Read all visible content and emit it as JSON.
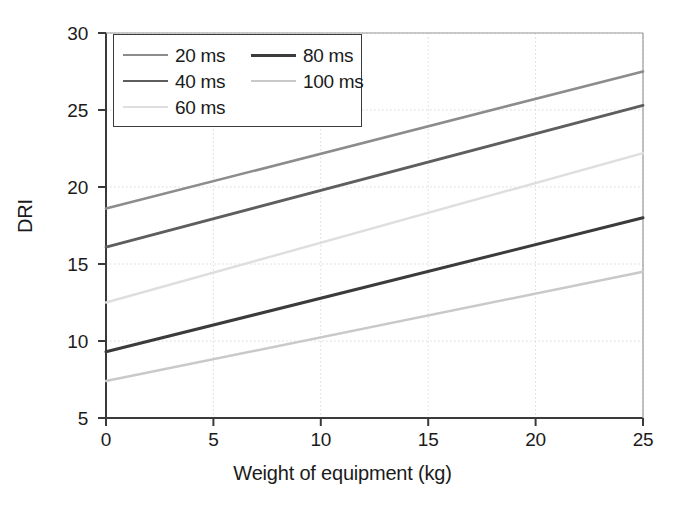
{
  "chart_data": {
    "type": "line",
    "title": "",
    "xlabel": "Weight of equipment (kg)",
    "ylabel": "DRI",
    "xlim": [
      0,
      25
    ],
    "ylim": [
      5,
      30
    ],
    "xticks": [
      0,
      5,
      10,
      15,
      20,
      25
    ],
    "yticks": [
      5,
      10,
      15,
      20,
      25,
      30
    ],
    "xtick_labels": [
      "0",
      "5",
      "10",
      "15",
      "20",
      "25"
    ],
    "ytick_labels": [
      "5",
      "10",
      "15",
      "20",
      "25",
      "30"
    ],
    "grid": "horizontal and vertical dotted light gridlines",
    "legend_position": "upper left inside axes",
    "x": [
      0,
      25
    ],
    "series": [
      {
        "name": "20 ms",
        "values": [
          18.6,
          27.5
        ],
        "color": "#8c8c8c",
        "width": 2.6
      },
      {
        "name": "40 ms",
        "values": [
          16.1,
          25.3
        ],
        "color": "#5e5e5e",
        "width": 2.8
      },
      {
        "name": "60 ms",
        "values": [
          12.5,
          22.2
        ],
        "color": "#dedede",
        "width": 2.4
      },
      {
        "name": "80 ms",
        "values": [
          9.3,
          18.0
        ],
        "color": "#3b3b3b",
        "width": 3.0
      },
      {
        "name": "100 ms",
        "values": [
          7.4,
          14.5
        ],
        "color": "#c9c9c9",
        "width": 2.4
      }
    ]
  },
  "legend": {
    "entries": [
      {
        "label": "20 ms"
      },
      {
        "label": "80 ms"
      },
      {
        "label": "40 ms"
      },
      {
        "label": "100 ms"
      },
      {
        "label": "60 ms"
      }
    ]
  },
  "colors": {
    "axis": "#3a3a3a",
    "grid": "#d8d8d8",
    "text": "#1b1b1b",
    "background": "#ffffff"
  }
}
